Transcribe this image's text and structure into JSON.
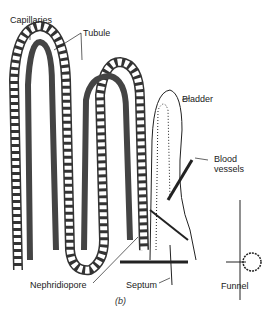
{
  "diagram": {
    "type": "anatomical-illustration",
    "labels": {
      "capillaries": "Capillaries",
      "tubule": "Tubule",
      "bladder": "Bladder",
      "blood_vessels_1": "Blood",
      "blood_vessels_2": "vessels",
      "nephridiopore": "Nephridiopore",
      "septum": "Septum",
      "funnel": "Funnel"
    },
    "caption": "(b)"
  }
}
